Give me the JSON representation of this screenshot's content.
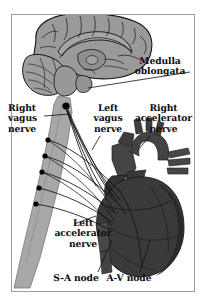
{
  "figure": {
    "background_color": "#ffffff",
    "frame_color": "#9b9b9b"
  },
  "colors": {
    "brain_fill": "#9a9a9a",
    "brain_outline": "#1a1a1a",
    "cord_fill": "#a8a8a8",
    "heart_fill": "#3a3a3a",
    "heart_dark": "#242424",
    "heart_mid": "#4c4c4c",
    "vessel_fill": "#454545",
    "nerve_line": "#101010",
    "node_dot": "#000000",
    "label_text": "#0d0d0d"
  },
  "labels": {
    "medulla": {
      "line1": "Medulla",
      "line2": "oblongata"
    },
    "right_vagus": {
      "line1": "Right",
      "line2": "vagus",
      "line3": "nerve"
    },
    "left_vagus": {
      "line1": "Left",
      "line2": "vagus",
      "line3": "nerve"
    },
    "right_accelerator": {
      "line1": "Right",
      "line2": "accelerator",
      "line3": "nerve"
    },
    "left_accelerator": {
      "line1": "Left",
      "line2": "accelerator",
      "line3": "nerve"
    },
    "sa_node": {
      "line1": "S-A node"
    },
    "av_node": {
      "line1": "A-V node"
    }
  },
  "anatomy": {
    "brain": "mid-sagittal-brain",
    "cerebellum": "cerebellum",
    "medulla": "medulla-oblongata",
    "spinal_cord": "spinal-cord",
    "heart": "heart",
    "aorta": "aortic-arch",
    "pulmonary_trunk": "pulmonary-trunk",
    "superior_vena_cava": "superior-vena-cava",
    "ganglion_count": 5
  }
}
